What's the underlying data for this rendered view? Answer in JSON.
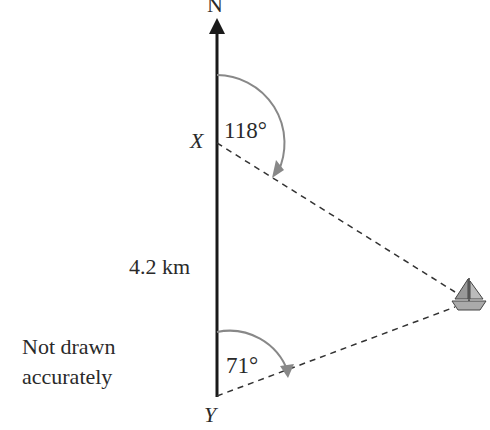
{
  "diagram": {
    "north_label": "N",
    "point_x_label": "X",
    "point_y_label": "Y",
    "distance_label": "4.2 km",
    "bearing_from_x": "118°",
    "bearing_from_y": "71°",
    "note_line1": "Not drawn",
    "note_line2": "accurately",
    "boat_icon": "sailboat-icon",
    "colors": {
      "line": "#1a1a1a",
      "dashed": "#333333",
      "arc": "#888888",
      "text": "#2a2a2a"
    }
  }
}
